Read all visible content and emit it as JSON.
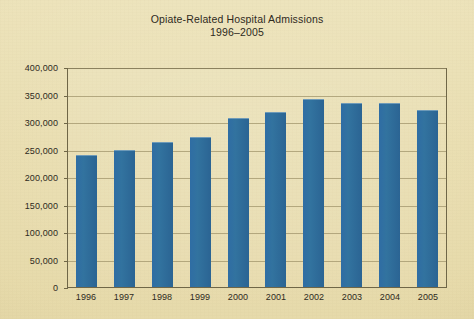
{
  "figure": {
    "title": "Opiate-Related Hospital Admissions",
    "subtitle": "1996–2005",
    "background_color": "#e9ddaf",
    "bar_color": "#2f6da4",
    "text_color": "#2e2a1d",
    "gridline_color": "#a99d74",
    "axis_color": "#6f6647"
  },
  "chart_data": {
    "type": "bar",
    "title": "Opiate-Related Hospital Admissions 1996–2005",
    "xlabel": "",
    "ylabel": "",
    "ylim": [
      0,
      400000
    ],
    "ytick_step": 50000,
    "grid": true,
    "legend": "none",
    "categories": [
      "1996",
      "1997",
      "1998",
      "1999",
      "2000",
      "2001",
      "2002",
      "2003",
      "2004",
      "2005"
    ],
    "values": [
      240000,
      249000,
      264000,
      272000,
      307000,
      318000,
      342000,
      335000,
      334000,
      322000
    ],
    "ytick_labels": [
      "0",
      "50,000",
      "100,000",
      "150,000",
      "200,000",
      "250,000",
      "300,000",
      "350,000",
      "400,000"
    ],
    "ytick_values": [
      0,
      50000,
      100000,
      150000,
      200000,
      250000,
      300000,
      350000,
      400000
    ]
  }
}
